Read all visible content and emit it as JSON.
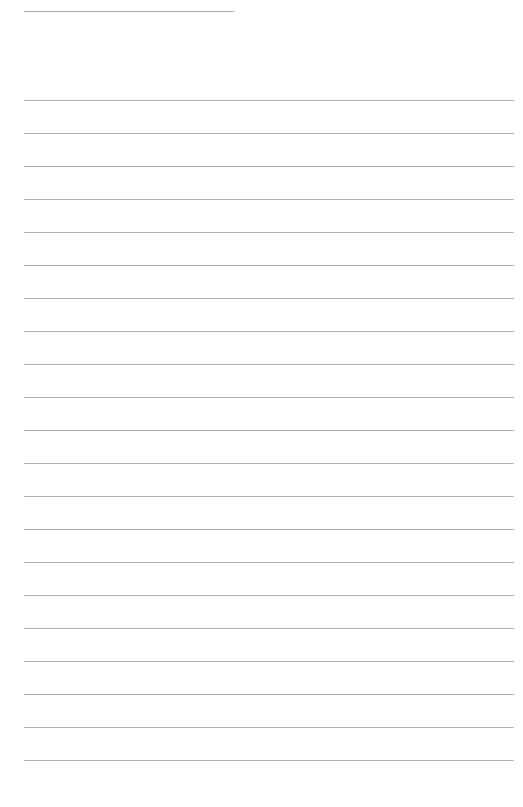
{
  "page": {
    "type": "lined-paper",
    "background_color": "#ffffff",
    "line_color": "#b2b2b2",
    "header_line": {
      "present": true,
      "color": "#adadad"
    },
    "ruled_lines": {
      "count": 21,
      "first_y": 100,
      "spacing": 33
    }
  }
}
